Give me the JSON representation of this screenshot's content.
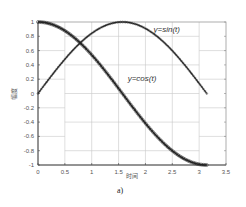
{
  "chart_data": {
    "type": "line",
    "title": "",
    "xlabel": "时间",
    "ylabel": "幅度",
    "xlim": [
      0,
      3.5
    ],
    "ylim": [
      -1,
      1
    ],
    "xticks": [
      "0",
      "0.5",
      "1",
      "1.5",
      "2",
      "2.5",
      "3",
      "3.5"
    ],
    "yticks": [
      "-1",
      "-0.8",
      "-0.6",
      "-0.4",
      "-0.2",
      "0",
      "0.2",
      "0.4",
      "0.6",
      "0.8",
      "1"
    ],
    "grid": true,
    "legend": "none",
    "t_range": [
      0,
      3.1416
    ],
    "series": [
      {
        "name": "y=sin(t)",
        "marker": "line with small markers",
        "color": "#222222",
        "x": [
          0,
          0.25,
          0.5,
          0.75,
          1.0,
          1.25,
          1.5,
          1.5708,
          1.75,
          2.0,
          2.25,
          2.5,
          2.75,
          3.0,
          3.1416
        ],
        "values": [
          0,
          0.247,
          0.479,
          0.682,
          0.841,
          0.949,
          0.997,
          1.0,
          0.984,
          0.909,
          0.778,
          0.598,
          0.382,
          0.141,
          0
        ]
      },
      {
        "name": "y=cos(t)",
        "marker": "dense circle markers",
        "color": "#222222",
        "x": [
          0,
          0.25,
          0.5,
          0.75,
          1.0,
          1.25,
          1.5,
          1.75,
          2.0,
          2.25,
          2.5,
          2.75,
          3.0,
          3.1416
        ],
        "values": [
          1.0,
          0.969,
          0.878,
          0.732,
          0.54,
          0.315,
          0.071,
          -0.178,
          -0.416,
          -0.628,
          -0.801,
          -0.924,
          -0.99,
          -1.0
        ]
      }
    ],
    "annotations": [
      {
        "text": "y=sin(t)",
        "x": 2.15,
        "y": 0.86
      },
      {
        "text": "y=cos(t)",
        "x": 1.67,
        "y": 0.18
      }
    ],
    "caption": "a)"
  }
}
